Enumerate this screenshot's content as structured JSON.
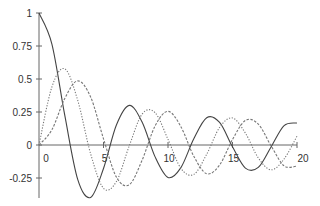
{
  "chart_data": {
    "type": "line",
    "title": "",
    "xlabel": "",
    "ylabel": "",
    "xlim": [
      0,
      20
    ],
    "ylim": [
      -0.4,
      1
    ],
    "grid": false,
    "legend": null,
    "x_ticks": [
      0,
      5,
      10,
      15,
      20
    ],
    "x_tick_labels": [
      "0",
      "5",
      "10",
      "15",
      "20"
    ],
    "y_ticks": [
      1,
      0.75,
      0.5,
      0.25,
      0,
      -0.25
    ],
    "y_tick_labels": [
      "1",
      "0.75",
      "0.5",
      "0.25",
      "0",
      "-0.25"
    ],
    "series": [
      {
        "name": "J0 (solid)",
        "style": "solid",
        "color": "#444444",
        "x": [
          0,
          1,
          2,
          3,
          4,
          5,
          6,
          7,
          8,
          9,
          10,
          11,
          12,
          13,
          14,
          15,
          16,
          17,
          18,
          19,
          20
        ],
        "values": [
          1.0,
          0.765,
          0.224,
          -0.26,
          -0.397,
          -0.178,
          0.151,
          0.3,
          0.172,
          -0.09,
          -0.246,
          -0.171,
          0.048,
          0.207,
          0.171,
          -0.014,
          -0.175,
          -0.17,
          -0.013,
          0.147,
          0.167
        ]
      },
      {
        "name": "J1 (dotted)",
        "style": "dotted",
        "color": "#777777",
        "x": [
          0,
          1,
          2,
          3,
          4,
          5,
          6,
          7,
          8,
          9,
          10,
          11,
          12,
          13,
          14,
          15,
          16,
          17,
          18,
          19,
          20
        ],
        "values": [
          0.0,
          0.44,
          0.577,
          0.339,
          -0.066,
          -0.328,
          -0.277,
          -0.005,
          0.235,
          0.245,
          0.043,
          -0.177,
          -0.223,
          -0.07,
          0.133,
          0.205,
          0.09,
          -0.098,
          -0.188,
          -0.106,
          0.067
        ]
      },
      {
        "name": "J2 (dashed)",
        "style": "dashed",
        "color": "#777777",
        "x": [
          0,
          1,
          2,
          3,
          4,
          5,
          6,
          7,
          8,
          9,
          10,
          11,
          12,
          13,
          14,
          15,
          16,
          17,
          18,
          19,
          20
        ],
        "values": [
          0.0,
          0.115,
          0.353,
          0.486,
          0.364,
          0.047,
          -0.243,
          -0.301,
          -0.113,
          0.145,
          0.255,
          0.139,
          -0.085,
          -0.218,
          -0.152,
          0.042,
          0.186,
          0.158,
          -0.008,
          -0.158,
          -0.16
        ]
      }
    ]
  }
}
